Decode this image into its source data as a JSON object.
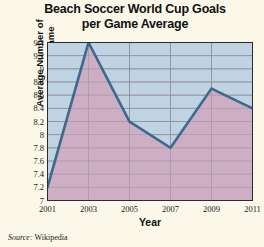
{
  "chart_data": {
    "type": "area",
    "title": "Beach Soccer World Cup Goals per Game Average",
    "title_line1": "Beach Soccer World Cup Goals",
    "title_line2": "per Game Average",
    "xlabel": "Year",
    "ylabel": "Average Number of Goals per Game",
    "ylabel_line1": "Average Number of",
    "ylabel_line2": "Goals per Game",
    "x": [
      2001,
      2003,
      2005,
      2007,
      2009,
      2011
    ],
    "values": [
      7.2,
      9.4,
      8.2,
      7.8,
      8.7,
      8.4
    ],
    "categories": [
      "2001",
      "2003",
      "2005",
      "2007",
      "2009",
      "2011"
    ],
    "xtick_labels": [
      "2001",
      "2003",
      "2005",
      "2007",
      "2009",
      "2011"
    ],
    "ytick_labels": [
      "9.4",
      "9.2",
      "9",
      "8.8",
      "8.6",
      "8.4",
      "8.2",
      "8",
      "7.8",
      "7.6",
      "7.4",
      "7.2",
      "7"
    ],
    "ytick_values": [
      9.4,
      9.2,
      9.0,
      8.8,
      8.6,
      8.4,
      8.2,
      8.0,
      7.8,
      7.6,
      7.4,
      7.2,
      7.0
    ],
    "ylim": [
      7.0,
      9.4
    ],
    "xlim": [
      2001,
      2011
    ],
    "grid": true,
    "legend": "none",
    "series": [
      {
        "name": "Goals per Game Average",
        "values": [
          7.2,
          9.4,
          8.2,
          7.8,
          8.7,
          8.4
        ]
      }
    ],
    "colors": {
      "line": "#3d6a8a",
      "fill_below": "#cdaec4",
      "fill_above": "#bfd3e2",
      "background": "#fbf8ea",
      "grid": "#8a8a93",
      "axis": "#2b2b33"
    }
  },
  "source": {
    "prefix": "Source:",
    "value": "Wikipedia"
  }
}
